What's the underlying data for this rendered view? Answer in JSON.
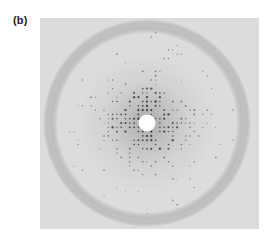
{
  "figure": {
    "panel_label": "(b)",
    "colors": {
      "background": "#dedede",
      "halo": "#c6c6c6",
      "ring": "#b9b9b9",
      "spot": "#3a3a3a",
      "beam_stop": "#ffffff"
    },
    "geometry": {
      "width": 219,
      "height": 211,
      "center_x": 107,
      "center_y": 105,
      "ring_radius": 98,
      "beam_stop_radius": 8,
      "lattice_spacing": 4.3
    }
  }
}
